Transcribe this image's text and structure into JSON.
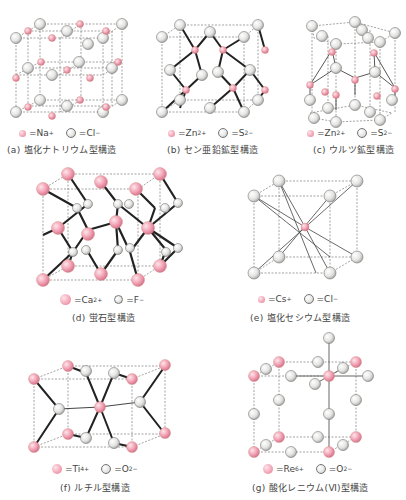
{
  "colors": {
    "cation": "#f2a3b5",
    "anion": "#e6e6e4",
    "dashed_edge": "#555555",
    "bond": "#222222"
  },
  "panels": [
    {
      "id": "a",
      "caption": "(a) 塩化ナトリウム型構造",
      "legend": {
        "cation": "Na",
        "cation_charge": "+",
        "anion": "Cl",
        "anion_charge": "−"
      }
    },
    {
      "id": "b",
      "caption": "(b) セン亜鉛鉱型構造",
      "legend": {
        "cation": "Zn",
        "cation_charge": "2+",
        "anion": "S",
        "anion_charge": "2−"
      }
    },
    {
      "id": "c",
      "caption": "(c) ウルツ鉱型構造",
      "legend": {
        "cation": "Zn",
        "cation_charge": "2+",
        "anion": "S",
        "anion_charge": "2−"
      }
    },
    {
      "id": "d",
      "caption": "(d) 蛍石型構造",
      "legend": {
        "cation": "Ca",
        "cation_charge": "2+",
        "anion": "F",
        "anion_charge": "−"
      }
    },
    {
      "id": "e",
      "caption": "(e) 塩化セシウム型構造",
      "legend": {
        "cation": "Cs",
        "cation_charge": "+",
        "anion": "Cl",
        "anion_charge": "−"
      }
    },
    {
      "id": "f",
      "caption": "(f) ルチル型構造",
      "legend": {
        "cation": "Ti",
        "cation_charge": "4+",
        "anion": "O",
        "anion_charge": "2−"
      }
    },
    {
      "id": "g",
      "caption": "(g) 酸化レニウム(Ⅵ)型構造",
      "legend": {
        "cation": "Re",
        "cation_charge": "6+",
        "anion": "O",
        "anion_charge": "2−"
      }
    }
  ],
  "legend_equals": "= "
}
